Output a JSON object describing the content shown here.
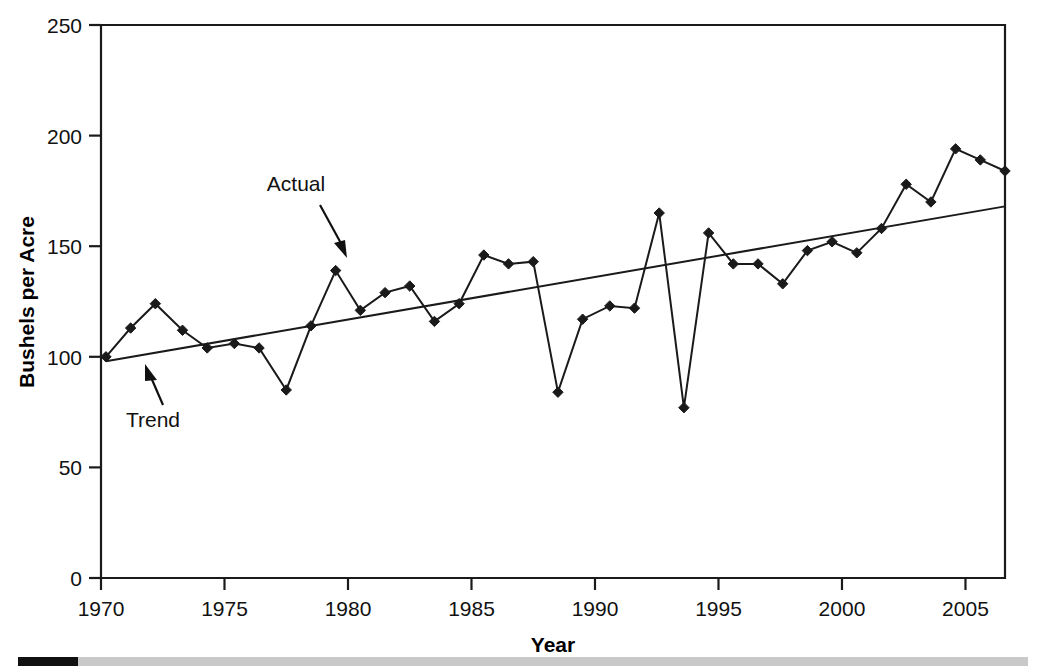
{
  "chart_data": {
    "type": "line",
    "title": "",
    "xlabel": "Year",
    "ylabel": "Bushels per Acre",
    "xlim": [
      1970,
      2006.6
    ],
    "ylim": [
      0,
      250
    ],
    "xticks": [
      1970,
      1975,
      1980,
      1985,
      1990,
      1995,
      2000,
      2005
    ],
    "xticklabels": [
      "1970",
      "1975",
      "1980",
      "1985",
      "1990",
      "1995",
      "2000",
      "2005"
    ],
    "yticks": [
      0,
      50,
      100,
      150,
      200,
      250
    ],
    "yticklabels": [
      "0",
      "50",
      "100",
      "150",
      "200",
      "250"
    ],
    "grid": false,
    "legend": "none",
    "annotations": [
      {
        "text": "Actual",
        "points_to_series": "Actual",
        "x": 1979.5,
        "y": 139
      },
      {
        "text": "Trend",
        "points_to_series": "Trend",
        "x": 1972.2,
        "y": 103
      }
    ],
    "x": [
      1970.2,
      1971.2,
      1972.2,
      1973.3,
      1974.3,
      1975.4,
      1976.4,
      1977.5,
      1978.5,
      1979.5,
      1980.5,
      1981.5,
      1982.5,
      1983.5,
      1984.5,
      1985.5,
      1986.5,
      1987.5,
      1988.5,
      1989.5,
      1990.6,
      1991.6,
      1992.6,
      1993.6,
      1994.6,
      1995.6,
      1996.6,
      1997.6,
      1998.6,
      1999.6,
      2000.6,
      2001.6,
      2002.6,
      2003.6,
      2004.6,
      2005.6,
      2006.6
    ],
    "series": [
      {
        "name": "Actual",
        "marker": "diamond",
        "color": "#1a1a1a",
        "values": [
          100,
          113,
          124,
          112,
          104,
          106,
          104,
          85,
          114,
          139,
          121,
          129,
          132,
          116,
          124,
          146,
          142,
          143,
          84,
          117,
          123,
          122,
          165,
          77,
          156,
          142,
          142,
          133,
          148,
          152,
          147,
          158,
          178,
          170,
          194,
          189,
          184
        ]
      },
      {
        "name": "Trend",
        "marker": "none",
        "color": "#1a1a1a",
        "start_value": 98,
        "end_value": 168
      }
    ]
  },
  "footer": {
    "bar_black_color": "#111111",
    "bar_gray_color": "#c9c9c9"
  }
}
